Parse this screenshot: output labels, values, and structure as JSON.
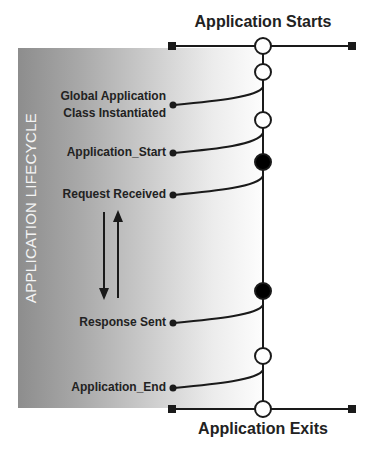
{
  "diagram": {
    "side_label": "APPLICATION LIFECYCLE",
    "top_title": "Application Starts",
    "bottom_title": "Application Exits",
    "events": [
      {
        "lines": [
          "Global Application",
          "Class Instantiated"
        ],
        "dot_y": 105,
        "join_y": 87
      },
      {
        "lines": [
          "Application_Start"
        ],
        "dot_y": 153,
        "join_y": 133
      },
      {
        "lines": [
          "Request Received"
        ],
        "dot_y": 195,
        "join_y": 176
      },
      {
        "lines": [
          "Response Sent"
        ],
        "dot_y": 323,
        "join_y": 305
      },
      {
        "lines": [
          "Application_End"
        ],
        "dot_y": 388,
        "join_y": 370
      }
    ],
    "timeline_nodes": [
      {
        "y": 46,
        "type": "open"
      },
      {
        "y": 72,
        "type": "open"
      },
      {
        "y": 120,
        "type": "open"
      },
      {
        "y": 162,
        "type": "filled"
      },
      {
        "y": 291,
        "type": "filled"
      },
      {
        "y": 356,
        "type": "open"
      },
      {
        "y": 409,
        "type": "open"
      }
    ],
    "request_loop": {
      "down_arrow": "request-to-response",
      "up_arrow": "response-to-request"
    },
    "colors": {
      "line": "#1a1a1a",
      "band_dark": "#8d8d8d",
      "band_light": "#ffffff",
      "side_label": "#f4f4f4"
    }
  }
}
